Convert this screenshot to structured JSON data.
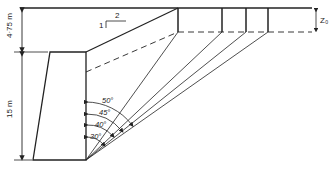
{
  "diagram": {
    "type": "retaining-wall-earth-pressure",
    "dimensions": {
      "upper_height": "4·75 m",
      "wall_height": "15 m",
      "crack_depth": "Z₀"
    },
    "slope": {
      "vertical": "1",
      "horizontal": "2"
    },
    "angles": [
      "50°",
      "45°",
      "40°",
      "30°"
    ],
    "colors": {
      "line": "#222222",
      "background": "#ffffff"
    }
  }
}
